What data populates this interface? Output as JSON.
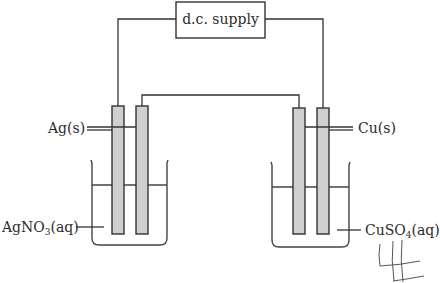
{
  "diagram": {
    "supply": {
      "label": "d.c. supply"
    },
    "left_cell": {
      "electrode_label": "Ag(s)",
      "electrolyte_label_main": "AgNO",
      "electrolyte_label_sub": "3",
      "electrolyte_label_tail": "(aq)"
    },
    "right_cell": {
      "electrode_label": "Cu(s)",
      "electrolyte_label_main": "CuSO",
      "electrolyte_label_sub": "4",
      "electrolyte_label_tail": "(aq)"
    },
    "annotation": {
      "handwritten_mark": "#"
    }
  }
}
